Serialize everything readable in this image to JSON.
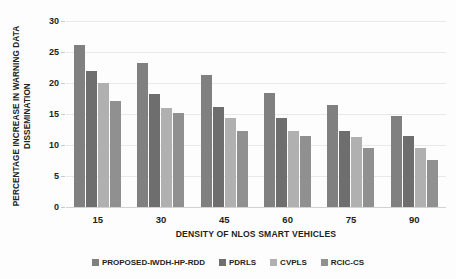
{
  "chart_data": {
    "type": "bar",
    "title": "",
    "xlabel": "DENSITY OF NLOS SMART VEHICLES",
    "ylabel": "PERCENTAGE INCREASE IN WARNING DATA DISSEMINATION",
    "ylabel_line1": "PERCENTAGE INCREASE IN WARNING DATA",
    "ylabel_line2": "DISSEMINATION",
    "categories": [
      "15",
      "30",
      "45",
      "60",
      "75",
      "90"
    ],
    "ylim": [
      0,
      30
    ],
    "yticks": [
      "0",
      "5",
      "10",
      "15",
      "20",
      "25",
      "30"
    ],
    "grid": true,
    "legend_position": "bottom",
    "series": [
      {
        "name": "PROPOSED-IWDH-HP-RDD",
        "color": "#808080",
        "values": [
          26.1,
          23.2,
          21.3,
          18.4,
          16.4,
          14.6
        ]
      },
      {
        "name": "PDRLS",
        "color": "#6e6e6e",
        "values": [
          22.0,
          18.2,
          16.2,
          14.3,
          12.3,
          11.5
        ]
      },
      {
        "name": "CVPLS",
        "color": "#b0b0b0",
        "values": [
          20.0,
          16.0,
          14.3,
          12.3,
          11.3,
          9.5
        ]
      },
      {
        "name": "RCIC-CS",
        "color": "#909090",
        "values": [
          17.1,
          15.2,
          12.3,
          11.4,
          9.5,
          7.6
        ]
      }
    ]
  }
}
